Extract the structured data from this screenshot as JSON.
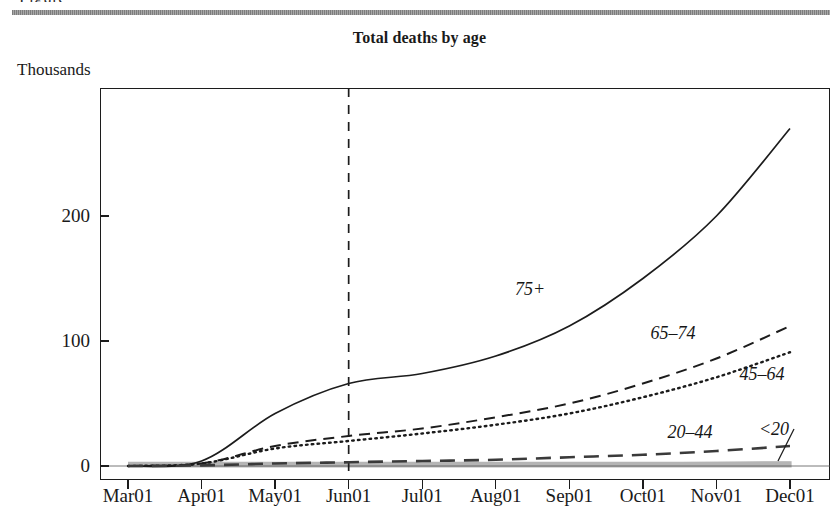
{
  "header": {
    "clipped_caption": "Figure",
    "rule_color": "#8d8d8d"
  },
  "chart_data": {
    "type": "line",
    "title": "Total deaths by age",
    "subtitle": "",
    "ylabel": "Thousands",
    "xlabel": "",
    "ylim": [
      -8,
      290
    ],
    "yticks": [
      0,
      100,
      200
    ],
    "ytick_labels": [
      "0",
      "100",
      "200"
    ],
    "grid": false,
    "legend_position": "inline-annotations",
    "categories": [
      "Mar01",
      "Apr01",
      "May01",
      "Jun01",
      "Jul01",
      "Aug01",
      "Sep01",
      "Oct01",
      "Nov01",
      "Dec01"
    ],
    "x": [
      "Mar01",
      "Apr01",
      "May01",
      "Jun01",
      "Jul01",
      "Aug01",
      "Sep01",
      "Oct01",
      "Nov01",
      "Dec01"
    ],
    "annotations": [
      {
        "text": "Jun01 reference line",
        "type": "vline",
        "at": "Jun01",
        "style": "dashed"
      },
      {
        "text": "<20",
        "type": "leader-line",
        "points_to": "shaded band near zero"
      }
    ],
    "series": [
      {
        "name": "75+",
        "label": "75+",
        "style": "solid",
        "color": "#1c1c1c",
        "values": [
          0,
          4,
          42,
          66,
          74,
          88,
          112,
          150,
          200,
          270
        ]
      },
      {
        "name": "65-74",
        "label": "65–74",
        "style": "dashed",
        "color": "#1c1c1c",
        "values": [
          0,
          2,
          16,
          24,
          30,
          39,
          50,
          66,
          86,
          112
        ]
      },
      {
        "name": "45-64",
        "label": "45–64",
        "style": "dotted",
        "color": "#1c1c1c",
        "values": [
          0,
          2,
          14,
          20,
          26,
          33,
          42,
          55,
          71,
          91
        ]
      },
      {
        "name": "20-44",
        "label": "20–44",
        "style": "long-dashed",
        "color": "#3a3a3a",
        "values": [
          0,
          0.5,
          2,
          3,
          4,
          5,
          7,
          9,
          12,
          16
        ]
      },
      {
        "name": "<20",
        "label": "<20",
        "style": "shaded-band",
        "color": "#b5b5b5",
        "values": [
          0,
          0.2,
          0.5,
          0.8,
          1,
          1.2,
          1.5,
          1.8,
          2.2,
          2.6
        ]
      }
    ]
  }
}
